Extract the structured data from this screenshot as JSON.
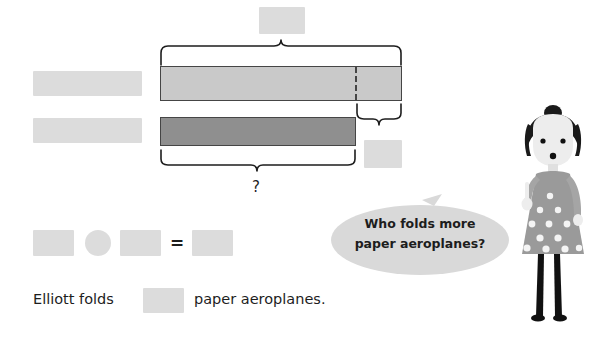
{
  "page": {
    "background_color": "#ffffff",
    "width": 604,
    "height": 339
  },
  "bar_model": {
    "description": "Comparison bar model with two bars and braces",
    "top_bar": {
      "label": "light-bar",
      "fill_color": "#c9c9c9",
      "border_color": "#454545",
      "has_dashed_divider": true
    },
    "bottom_bar": {
      "label": "dark-bar",
      "fill_color": "#8f8f8f",
      "border_color": "#454545"
    },
    "braces": {
      "top_total": "whole of the light bar",
      "right_difference": "difference segment",
      "bottom_total": "whole of the dark bar"
    },
    "unknown_label": "?"
  },
  "blanks": {
    "total_box": "",
    "top_row_label_box": "",
    "bottom_row_label_box": "",
    "difference_box": "",
    "equation_left": "",
    "equation_operator": "",
    "equation_right": "",
    "equation_answer": "",
    "sentence_answer": ""
  },
  "equation": {
    "equals_sign": "="
  },
  "sentence": {
    "before": "Elliott folds",
    "after": "paper aeroplanes."
  },
  "speech_bubble": {
    "line1": "Who folds more",
    "line2": "paper aeroplanes?",
    "fill_color": "#d9d9d9"
  },
  "character": {
    "name": "girl-character",
    "hair_color": "#1a1a1a",
    "skin_color": "#ededed",
    "dress_color": "#9a9a9a",
    "legs_color": "#111111"
  },
  "colors": {
    "blank_fill": "#dcdcdc",
    "ink": "#1d1d1d"
  }
}
